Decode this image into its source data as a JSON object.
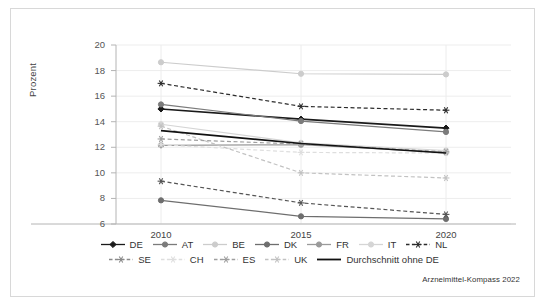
{
  "source_note": "Arzneimittel-Kompass 2022",
  "axis": {
    "ylabel": "Prozent",
    "yticks": [
      "20",
      "18",
      "16",
      "14",
      "12",
      "10",
      "8",
      "6"
    ],
    "xticks": [
      "2010",
      "2015",
      "2020"
    ]
  },
  "legend": {
    "row1": [
      {
        "label": "DE",
        "style": "solid-diamond",
        "color": "#1a1a1a"
      },
      {
        "label": "AT",
        "style": "solid-circle",
        "color": "#7b7b7b"
      },
      {
        "label": "BE",
        "style": "solid-circle",
        "color": "#cccccc"
      },
      {
        "label": "DK",
        "style": "solid-circle",
        "color": "#6e6e6e"
      },
      {
        "label": "FR",
        "style": "solid-circle",
        "color": "#9a9a9a"
      },
      {
        "label": "IT",
        "style": "solid-circle",
        "color": "#d5d5d5"
      },
      {
        "label": "NL",
        "style": "dashed-star",
        "color": "#2b2b2b"
      }
    ],
    "row2": [
      {
        "label": "SE",
        "style": "dashed-star",
        "color": "#8a8a8a"
      },
      {
        "label": "CH",
        "style": "dashed-star",
        "color": "#dedede"
      },
      {
        "label": "ES",
        "style": "dashed-star",
        "color": "#9f9f9f"
      },
      {
        "label": "UK",
        "style": "dashed-star",
        "color": "#c2c2c2"
      },
      {
        "label": "Durchschnitt ohne DE",
        "style": "solid-plain",
        "color": "#111111"
      }
    ]
  },
  "chart_data": {
    "type": "line",
    "title": "",
    "xlabel": "",
    "ylabel": "Prozent",
    "x": [
      "2010",
      "2015",
      "2020"
    ],
    "ylim": [
      6,
      20
    ],
    "ytick_step": 2,
    "grid": true,
    "legend_position": "bottom",
    "series": [
      {
        "name": "DE",
        "values": [
          15.0,
          14.2,
          13.5
        ],
        "color": "#1a1a1a",
        "dash": "solid",
        "marker": "diamond"
      },
      {
        "name": "AT",
        "values": [
          15.35,
          14.05,
          13.2
        ],
        "color": "#7b7b7b",
        "dash": "solid",
        "marker": "circle"
      },
      {
        "name": "BE",
        "values": [
          18.65,
          17.75,
          17.7
        ],
        "color": "#cccccc",
        "dash": "solid",
        "marker": "circle"
      },
      {
        "name": "DK",
        "values": [
          7.85,
          6.6,
          6.4
        ],
        "color": "#6e6e6e",
        "dash": "solid",
        "marker": "circle"
      },
      {
        "name": "FR",
        "values": [
          12.15,
          12.2,
          11.6
        ],
        "color": "#9a9a9a",
        "dash": "solid",
        "marker": "circle"
      },
      {
        "name": "IT",
        "values": [
          13.8,
          12.35,
          11.75
        ],
        "color": "#d5d5d5",
        "dash": "solid",
        "marker": "circle"
      },
      {
        "name": "NL",
        "values": [
          17.0,
          15.2,
          14.9
        ],
        "color": "#2b2b2b",
        "dash": "dashed",
        "marker": "star"
      },
      {
        "name": "SE",
        "values": [
          9.35,
          7.65,
          6.75
        ],
        "color": "#555555",
        "dash": "dashed",
        "marker": "star"
      },
      {
        "name": "CH",
        "values": [
          12.2,
          11.6,
          11.55
        ],
        "color": "#dedede",
        "dash": "dashed",
        "marker": "star"
      },
      {
        "name": "ES",
        "values": [
          12.65,
          12.25,
          11.65
        ],
        "color": "#9f9f9f",
        "dash": "dashed",
        "marker": "star"
      },
      {
        "name": "UK",
        "values": [
          13.65,
          10.0,
          9.6
        ],
        "color": "#c2c2c2",
        "dash": "dashed",
        "marker": "star"
      },
      {
        "name": "Durchschnitt ohne DE",
        "values": [
          13.3,
          12.3,
          11.55
        ],
        "color": "#111111",
        "dash": "solid",
        "marker": "none"
      }
    ]
  }
}
